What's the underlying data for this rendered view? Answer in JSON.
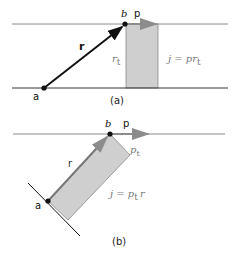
{
  "diagram_a": {
    "caption": "(a)",
    "point_a": "a",
    "point_b": "b",
    "vector_r": "r",
    "vector_p": "p",
    "label_rt": "r",
    "label_rt_sub": "t",
    "equation": "j = pr",
    "equation_sub": "t"
  },
  "diagram_b": {
    "caption": "(b)",
    "point_a": "a",
    "point_b": "b",
    "vector_r": "r",
    "vector_p": "p",
    "label_pt": "p",
    "label_pt_sub": "t",
    "equation_prefix": "j = p",
    "equation_sub": "t",
    "equation_suffix": "r"
  },
  "colors": {
    "line": "#8a8a8a",
    "dark": "#111111",
    "fill": "#cfcfcf",
    "text_gray": "#7a7a7a",
    "arrow_gray": "#8c8c8c"
  }
}
